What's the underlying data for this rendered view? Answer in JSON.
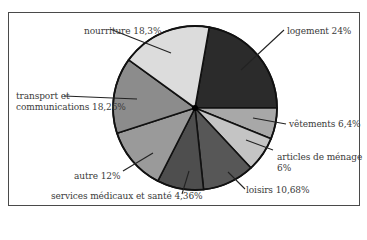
{
  "chart_data": {
    "type": "pie",
    "title": "",
    "slices": [
      {
        "label": "logement",
        "value": 24,
        "display": "logement  24%",
        "color": "#2b2b2b",
        "start_deg": -80,
        "end_deg": 0
      },
      {
        "label": "vêtements",
        "value": 6.4,
        "display": "vêtements  6,4%",
        "color": "#a8a8a8",
        "start_deg": 0,
        "end_deg": 22
      },
      {
        "label": "articles de ménage",
        "value": 6,
        "display": "articles de ménage 6%",
        "color": "#c4c4c4",
        "start_deg": 22,
        "end_deg": 47
      },
      {
        "label": "loisirs",
        "value": 10.68,
        "display": "loisirs  10,68%",
        "color": "#575757",
        "start_deg": 47,
        "end_deg": 84
      },
      {
        "label": "services médicaux et santé",
        "value": 4.36,
        "display": "services médicaux et santé  4,36%",
        "color": "#4e4e4e",
        "start_deg": 84,
        "end_deg": 117
      },
      {
        "label": "autre",
        "value": 12,
        "display": "autre  12%",
        "color": "#9a9a9a",
        "start_deg": 117,
        "end_deg": 162
      },
      {
        "label": "transport et communications",
        "value": 18.26,
        "display": "transport et communications  18,26%",
        "color": "#8c8c8c",
        "start_deg": 162,
        "end_deg": 216
      },
      {
        "label": "nourriture",
        "value": 18.3,
        "display": "nourriture  18,3%",
        "color": "#dcdcdc",
        "start_deg": 216,
        "end_deg": 280
      }
    ],
    "legend": "none (callout labels)",
    "center": [
      195,
      108
    ],
    "radius": 82
  },
  "labels": {
    "nourriture": "nourriture  18,3%",
    "logement": "logement  24%",
    "transport_line1": "transport et",
    "transport_line2": "communications  18,26%",
    "vetements": "vêtements  6,4%",
    "articles_line1": "articles de ménage",
    "articles_line2": "6%",
    "autre": "autre  12%",
    "loisirs": "loisirs  10,68%",
    "services": "services médicaux et santé  4,36%"
  }
}
